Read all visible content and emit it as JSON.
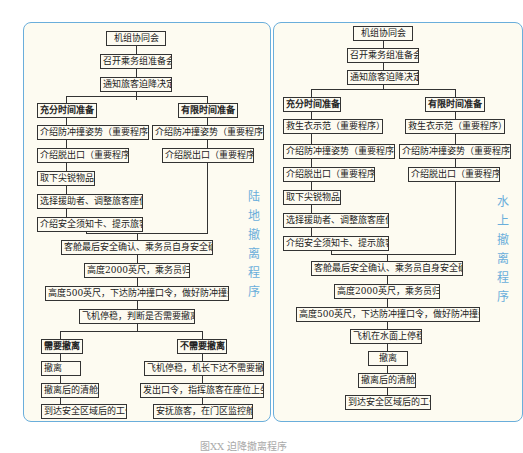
{
  "land": {
    "side_label": [
      "陆",
      "地",
      "撤",
      "离",
      "程",
      "序"
    ],
    "top": [
      "机组协同会",
      "召开乘务组准备会",
      "通知旅客迫降决定"
    ],
    "full_prep": {
      "title": "充分时间准备",
      "steps": [
        "介绍防冲撞姿势（重要程序）",
        "介绍脱出口（重要程序）",
        "取下尖锐物品",
        "选择援助者、调整旅客座位",
        "介绍安全须知卡、提示旅客"
      ]
    },
    "limited_prep": {
      "title": "有限时间准备",
      "steps": [
        "介绍防冲撞姿势（重要程序）",
        "介绍脱出口（重要程序）"
      ]
    },
    "common": [
      "客舱最后安全确认、乘务员自身安全确认",
      "高度2000英尺，乘务员归位",
      "高度500英尺，下达防冲撞口令，做好防冲撞姿势",
      "飞机停稳，判断是否需要撤离"
    ],
    "evacuate": {
      "title": "需要撤离",
      "steps": [
        "撤离",
        "撤离后的清舱",
        "到达安全区域后的工作"
      ]
    },
    "no_evacuate": {
      "title": "不需要撤离",
      "steps": [
        "飞机停稳，机长下达不需要撤离",
        "发出口令，指挥旅客在座位上坐好",
        "安抚旅客，在门区监控舱门"
      ]
    }
  },
  "water": {
    "side_label": [
      "水",
      "上",
      "撤",
      "离",
      "程",
      "序"
    ],
    "top": [
      "机组协同会",
      "召开乘务组准备会",
      "通知旅客迫降决定"
    ],
    "full_prep": {
      "title": "充分时间准备",
      "steps": [
        "救生衣示范（重要程序）",
        "介绍防冲撞姿势（重要程序）",
        "介绍脱出口（重要程序）",
        "取下尖锐物品",
        "选择援助者、调整旅客座位",
        "介绍安全须知卡、提示旅客"
      ]
    },
    "limited_prep": {
      "title": "有限时间准备",
      "steps": [
        "救生衣示范（重要程序）",
        "介绍防冲撞姿势（重要程序）",
        "介绍脱出口（重要程序）"
      ]
    },
    "common": [
      "客舱最后安全确认、乘务员自身安全确认",
      "高度2000英尺，乘务员归位",
      "高度500英尺，下达防冲撞口令，做好防冲撞姿势",
      "飞机在水面上停稳",
      "撤离",
      "撤离后的清舱",
      "到达安全区域后的工作"
    ]
  },
  "caption": "图XX 迫降撤离程序"
}
